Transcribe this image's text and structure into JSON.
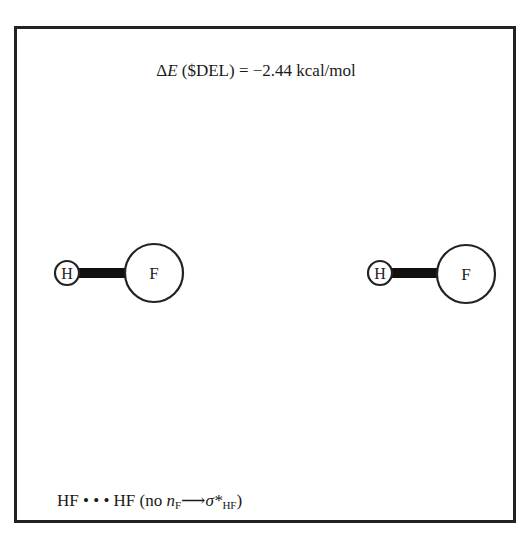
{
  "header_cutoff_text": "… fragment of preceding text (cropped) …",
  "figure": {
    "energy_label": {
      "prefix_symbol": "Δ",
      "prefix_var": "E",
      "rest": " ($DEL) = −2.44 kcal/mol"
    },
    "molecules": [
      {
        "name": "HF-left",
        "atoms": [
          {
            "symbol": "H"
          },
          {
            "symbol": "F"
          }
        ],
        "bond": "H–F"
      },
      {
        "name": "HF-right",
        "atoms": [
          {
            "symbol": "H"
          },
          {
            "symbol": "F"
          }
        ],
        "bond": "H–F"
      }
    ],
    "caption": {
      "main": "HF • • • HF (no ",
      "n": "n",
      "n_sub": "F",
      "arrow": "⟶",
      "sigma": "σ*",
      "sigma_sub": "HF",
      "close": ")"
    }
  }
}
